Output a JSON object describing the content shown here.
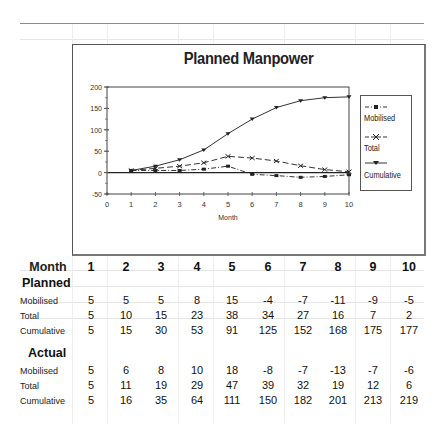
{
  "chart_data": {
    "type": "line",
    "title": "Planned Manpower",
    "xlabel": "Month",
    "ylabel": "",
    "x": [
      1,
      2,
      3,
      4,
      5,
      6,
      7,
      8,
      9,
      10
    ],
    "xlim": [
      0,
      10
    ],
    "ylim": [
      -50,
      200
    ],
    "x_ticks": [
      "0",
      "1",
      "2",
      "3",
      "4",
      "5",
      "6",
      "7",
      "8",
      "9",
      "10"
    ],
    "y_ticks": [
      "200",
      "150",
      "100",
      "50",
      "0",
      "-50"
    ],
    "grid": false,
    "legend_position": "right",
    "series": [
      {
        "name": "Mobilised",
        "values": [
          5,
          5,
          5,
          8,
          15,
          -4,
          -7,
          -11,
          -9,
          -5
        ],
        "style": "dash-dot",
        "marker": "square"
      },
      {
        "name": "Total",
        "values": [
          5,
          10,
          15,
          23,
          38,
          34,
          27,
          16,
          7,
          2
        ],
        "style": "dashed",
        "marker": "x"
      },
      {
        "name": "Cumulative",
        "values": [
          5,
          15,
          30,
          53,
          91,
          125,
          152,
          168,
          175,
          177
        ],
        "style": "solid",
        "marker": "triangle"
      }
    ]
  },
  "chart": {
    "title": "Planned Manpower",
    "xlabel": "Month",
    "legend": [
      "Mobilised",
      "Total",
      "Cumulative"
    ]
  },
  "table": {
    "header_label": "Month",
    "months": [
      "1",
      "2",
      "3",
      "4",
      "5",
      "6",
      "7",
      "8",
      "9",
      "10"
    ],
    "planned": {
      "section_label": "Planned",
      "rows": [
        {
          "label": "Mobilised",
          "values": [
            "5",
            "5",
            "5",
            "8",
            "15",
            "-4",
            "-7",
            "-11",
            "-9",
            "-5"
          ]
        },
        {
          "label": "Total",
          "values": [
            "5",
            "10",
            "15",
            "23",
            "38",
            "34",
            "27",
            "16",
            "7",
            "2"
          ]
        },
        {
          "label": "Cumulative",
          "values": [
            "5",
            "15",
            "30",
            "53",
            "91",
            "125",
            "152",
            "168",
            "175",
            "177"
          ]
        }
      ]
    },
    "actual": {
      "section_label": "Actual",
      "rows": [
        {
          "label": "Mobilised",
          "values": [
            "5",
            "6",
            "8",
            "10",
            "18",
            "-8",
            "-7",
            "-13",
            "-7",
            "-6"
          ]
        },
        {
          "label": "Total",
          "values": [
            "5",
            "11",
            "19",
            "29",
            "47",
            "39",
            "32",
            "19",
            "12",
            "6"
          ]
        },
        {
          "label": "Cumulative",
          "values": [
            "5",
            "16",
            "35",
            "64",
            "111",
            "150",
            "182",
            "201",
            "213",
            "219"
          ]
        }
      ]
    }
  }
}
